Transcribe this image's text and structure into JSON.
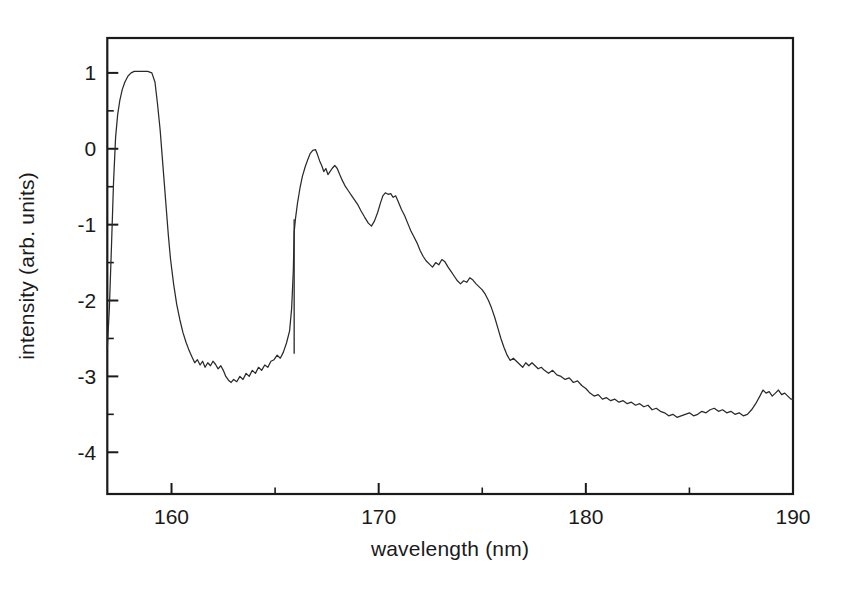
{
  "figure": {
    "background_color": "#ffffff",
    "curve_color": "#2a2a2a",
    "axis_color": "#1a1a1a"
  },
  "chart_data": {
    "type": "line",
    "title": "",
    "xlabel": "wavelength (nm)",
    "ylabel": "intensity (arb. units)",
    "xlim": [
      156.9,
      190.0
    ],
    "ylim": [
      -4.55,
      1.46
    ],
    "grid": false,
    "legend": null,
    "x_ticks_major": [
      160,
      170,
      180,
      190
    ],
    "x_tick_labels": [
      "160",
      "170",
      "180",
      "190"
    ],
    "x_ticks_minor": [
      165,
      175,
      185
    ],
    "y_ticks_major": [
      1,
      0,
      -1,
      -2,
      -3,
      -4
    ],
    "y_tick_labels": [
      "1",
      "0",
      "-1",
      "-2",
      "-3",
      "-4"
    ],
    "y_ticks_minor": [
      0.5,
      -0.5,
      -1.5,
      -2.5,
      -3.5
    ],
    "series": [
      {
        "name": "emission spectrum",
        "x": [
          156.9,
          157.0,
          157.1,
          157.2,
          157.3,
          157.4,
          157.5,
          157.62,
          157.75,
          157.9,
          158.05,
          158.2,
          158.4,
          158.6,
          158.85,
          159.05,
          159.2,
          159.32,
          159.45,
          159.55,
          159.65,
          159.75,
          159.85,
          159.95,
          160.1,
          160.25,
          160.4,
          160.55,
          160.7,
          160.85,
          161.0,
          161.12,
          161.25,
          161.38,
          161.5,
          161.62,
          161.75,
          161.88,
          162.0,
          162.12,
          162.25,
          162.38,
          162.5,
          162.62,
          162.75,
          162.88,
          163.0,
          163.15,
          163.3,
          163.45,
          163.6,
          163.75,
          163.9,
          164.05,
          164.2,
          164.35,
          164.5,
          164.65,
          164.8,
          164.95,
          165.1,
          165.25,
          165.4,
          165.55,
          165.7,
          165.8,
          165.88,
          165.92,
          165.98,
          166.08,
          166.2,
          166.32,
          166.45,
          166.58,
          166.7,
          166.82,
          166.95,
          167.05,
          167.15,
          167.25,
          167.35,
          167.45,
          167.55,
          167.65,
          167.75,
          167.88,
          168.0,
          168.12,
          168.25,
          168.4,
          168.55,
          168.7,
          168.85,
          169.0,
          169.15,
          169.32,
          169.5,
          169.65,
          169.8,
          169.95,
          170.08,
          170.2,
          170.32,
          170.45,
          170.58,
          170.7,
          170.82,
          170.95,
          171.1,
          171.25,
          171.4,
          171.55,
          171.7,
          171.85,
          172.0,
          172.15,
          172.3,
          172.45,
          172.6,
          172.75,
          172.9,
          173.05,
          173.2,
          173.35,
          173.5,
          173.65,
          173.8,
          173.95,
          174.1,
          174.25,
          174.4,
          174.55,
          174.7,
          174.85,
          175.0,
          175.15,
          175.3,
          175.45,
          175.6,
          175.75,
          175.9,
          176.05,
          176.2,
          176.35,
          176.5,
          176.65,
          176.8,
          176.95,
          177.1,
          177.25,
          177.4,
          177.55,
          177.7,
          177.85,
          178.0,
          178.2,
          178.4,
          178.6,
          178.8,
          179.0,
          179.2,
          179.4,
          179.6,
          179.8,
          180.0,
          180.2,
          180.4,
          180.6,
          180.8,
          181.0,
          181.2,
          181.4,
          181.6,
          181.8,
          182.0,
          182.2,
          182.4,
          182.6,
          182.8,
          183.0,
          183.2,
          183.4,
          183.6,
          183.8,
          184.0,
          184.2,
          184.4,
          184.6,
          184.8,
          185.0,
          185.2,
          185.4,
          185.6,
          185.8,
          186.0,
          186.2,
          186.4,
          186.6,
          186.8,
          187.0,
          187.2,
          187.4,
          187.6,
          187.8,
          188.0,
          188.2,
          188.4,
          188.55,
          188.7,
          188.85,
          189.0,
          189.15,
          189.3,
          189.45,
          189.6,
          189.75,
          189.9,
          190.0
        ],
        "y": [
          -2.63,
          -2.1,
          -1.3,
          -0.45,
          0.15,
          0.45,
          0.63,
          0.78,
          0.88,
          0.96,
          1.0,
          1.02,
          1.02,
          1.02,
          1.02,
          1.0,
          0.88,
          0.6,
          0.25,
          -0.1,
          -0.45,
          -0.8,
          -1.15,
          -1.45,
          -1.78,
          -2.05,
          -2.25,
          -2.42,
          -2.55,
          -2.66,
          -2.75,
          -2.82,
          -2.78,
          -2.85,
          -2.8,
          -2.88,
          -2.82,
          -2.86,
          -2.8,
          -2.84,
          -2.9,
          -2.86,
          -2.92,
          -3.0,
          -3.05,
          -3.08,
          -3.04,
          -3.07,
          -3.0,
          -3.04,
          -2.96,
          -3.0,
          -2.92,
          -2.96,
          -2.88,
          -2.92,
          -2.85,
          -2.88,
          -2.8,
          -2.78,
          -2.72,
          -2.76,
          -2.68,
          -2.56,
          -2.4,
          -2.1,
          -1.6,
          -1.1,
          -0.93,
          -0.72,
          -0.52,
          -0.36,
          -0.24,
          -0.14,
          -0.06,
          -0.02,
          -0.01,
          -0.08,
          -0.16,
          -0.22,
          -0.3,
          -0.26,
          -0.34,
          -0.3,
          -0.26,
          -0.22,
          -0.26,
          -0.34,
          -0.42,
          -0.5,
          -0.56,
          -0.62,
          -0.68,
          -0.74,
          -0.82,
          -0.9,
          -0.98,
          -1.02,
          -0.95,
          -0.84,
          -0.72,
          -0.62,
          -0.58,
          -0.6,
          -0.59,
          -0.64,
          -0.62,
          -0.7,
          -0.8,
          -0.88,
          -0.98,
          -1.08,
          -1.16,
          -1.24,
          -1.34,
          -1.42,
          -1.48,
          -1.52,
          -1.56,
          -1.5,
          -1.53,
          -1.46,
          -1.49,
          -1.56,
          -1.62,
          -1.68,
          -1.74,
          -1.78,
          -1.74,
          -1.76,
          -1.7,
          -1.73,
          -1.78,
          -1.82,
          -1.86,
          -1.92,
          -2.0,
          -2.1,
          -2.22,
          -2.36,
          -2.5,
          -2.62,
          -2.72,
          -2.79,
          -2.76,
          -2.8,
          -2.84,
          -2.88,
          -2.82,
          -2.86,
          -2.82,
          -2.86,
          -2.9,
          -2.88,
          -2.92,
          -2.96,
          -2.92,
          -2.98,
          -3.0,
          -3.04,
          -3.02,
          -3.08,
          -3.06,
          -3.12,
          -3.16,
          -3.22,
          -3.26,
          -3.24,
          -3.3,
          -3.28,
          -3.32,
          -3.3,
          -3.34,
          -3.32,
          -3.36,
          -3.34,
          -3.38,
          -3.36,
          -3.4,
          -3.38,
          -3.44,
          -3.42,
          -3.46,
          -3.48,
          -3.52,
          -3.5,
          -3.54,
          -3.52,
          -3.5,
          -3.48,
          -3.52,
          -3.5,
          -3.46,
          -3.48,
          -3.44,
          -3.42,
          -3.46,
          -3.44,
          -3.48,
          -3.46,
          -3.5,
          -3.48,
          -3.52,
          -3.5,
          -3.44,
          -3.36,
          -3.26,
          -3.18,
          -3.22,
          -3.2,
          -3.26,
          -3.22,
          -3.18,
          -3.24,
          -3.22,
          -3.26,
          -3.3,
          -3.3
        ]
      }
    ],
    "annotations": [
      {
        "name": "vertical-artifact-line",
        "x": 165.92,
        "y_top": -0.93,
        "y_bottom": -2.7
      }
    ]
  }
}
